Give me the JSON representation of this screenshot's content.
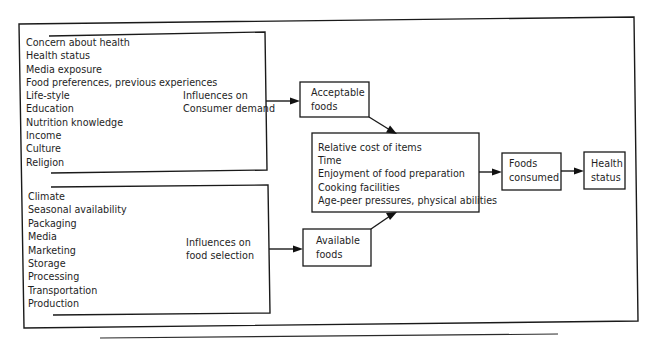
{
  "diagram": {
    "consumer_demand_group": {
      "factors": [
        "Concern about health",
        "Health status",
        "Media exposure",
        "Food preferences, previous experiences",
        "Life-style",
        "Education",
        "Nutrition knowledge",
        "Income",
        "Culture",
        "Religion"
      ],
      "label_line1": "Influences on",
      "label_line2": "Consumer demand"
    },
    "food_selection_group": {
      "factors": [
        "Climate",
        "Seasonal availability",
        "Packaging",
        "Media",
        "Marketing",
        "Storage",
        "Processing",
        "Transportation",
        "Production"
      ],
      "label_line1": "Influences on",
      "label_line2": "food selection"
    },
    "acceptable_foods": {
      "line1": "Acceptable",
      "line2": "foods"
    },
    "available_foods": {
      "line1": "Available",
      "line2": "foods"
    },
    "mediating_factors": [
      "Relative cost of items",
      "Time",
      "Enjoyment of  food preparation",
      "Cooking facilities",
      "Age-peer pressures, physical abilities"
    ],
    "foods_consumed": {
      "line1": "Foods",
      "line2": "consumed"
    },
    "health_status": {
      "line1": "Health",
      "line2": "status"
    },
    "colors": {
      "line": "#1a1a1a",
      "text": "#1e1e1e",
      "background": "#ffffff"
    }
  }
}
